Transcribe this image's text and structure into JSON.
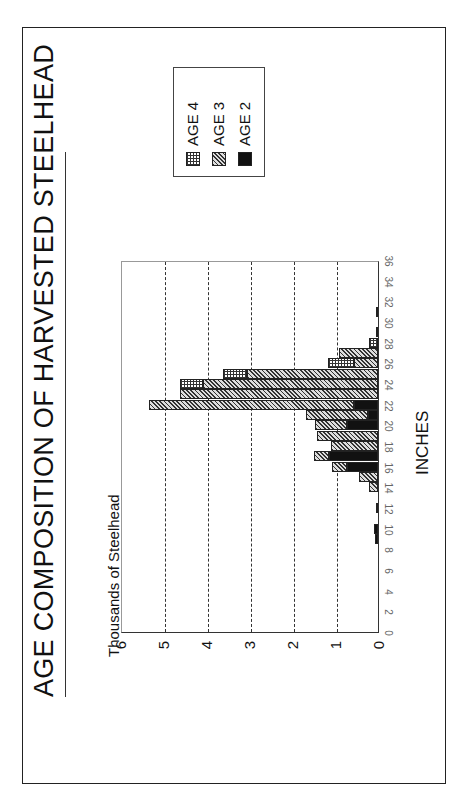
{
  "page": {
    "number": ""
  },
  "chart_data": {
    "type": "bar",
    "stacked": true,
    "orientation": "vertical (page printed rotated 90° counter-clockwise)",
    "title": "AGE COMPOSITION OF HARVESTED STEELHEAD",
    "xlabel": "INCHES",
    "ylabel": "Thousands of Steelhead",
    "ylim": [
      0,
      6
    ],
    "yticks": [
      "0",
      "1",
      "2",
      "3",
      "4",
      "5",
      "6"
    ],
    "xticks": [
      "0",
      "2",
      "4",
      "6",
      "8",
      "10",
      "12",
      "14",
      "16",
      "18",
      "20",
      "22",
      "24",
      "26",
      "28",
      "30",
      "32",
      "34",
      "36"
    ],
    "grid": "dashed horizontal at 1,2,3,4,5",
    "legend_position": "upper right",
    "categories": [
      9,
      10,
      12,
      14,
      15,
      16,
      17,
      18,
      19,
      20,
      21,
      22,
      23,
      24,
      25,
      26,
      27,
      28,
      29,
      31
    ],
    "series": [
      {
        "name": "AGE 2",
        "values": [
          0.08,
          0.1,
          0.03,
          0,
          0,
          0.72,
          1.13,
          0,
          0,
          0.72,
          0.24,
          0.55,
          0,
          0,
          0,
          0,
          0,
          0,
          0,
          0
        ]
      },
      {
        "name": "AGE 3",
        "values": [
          0,
          0,
          0,
          0.2,
          0.44,
          0.35,
          0.37,
          1.1,
          1.42,
          0.75,
          1.44,
          4.77,
          4.6,
          4.07,
          3.05,
          0.57,
          0.9,
          0,
          0.02,
          0.02
        ]
      },
      {
        "name": "AGE 4",
        "values": [
          0,
          0,
          0,
          0,
          0,
          0,
          0,
          0,
          0,
          0,
          0,
          0,
          0,
          0.53,
          0.55,
          0.59,
          0,
          0.22,
          0,
          0
        ]
      }
    ]
  },
  "legend": [
    {
      "label": "AGE 4",
      "pattern": "grid"
    },
    {
      "label": "AGE 3",
      "pattern": "hatched"
    },
    {
      "label": "AGE 2",
      "pattern": "solid",
      "color": "#111111"
    }
  ]
}
